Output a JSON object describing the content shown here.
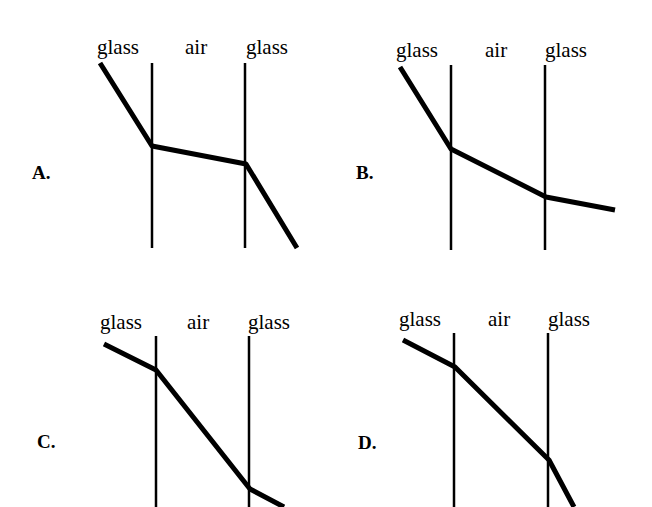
{
  "panels": [
    {
      "letter": "A.",
      "labels": [
        "glass",
        "air",
        "glass"
      ],
      "boundaries_x": [
        152,
        245
      ],
      "boundary_y": [
        63,
        248
      ],
      "ray": [
        [
          100,
          63
        ],
        [
          152,
          146
        ],
        [
          246,
          164
        ],
        [
          297,
          248
        ]
      ],
      "label_pos": [
        [
          97,
          37
        ],
        [
          185,
          37
        ],
        [
          246,
          37
        ]
      ],
      "letter_pos": [
        32,
        163
      ]
    },
    {
      "letter": "B.",
      "labels": [
        "glass",
        "air",
        "glass"
      ],
      "boundaries_x": [
        451,
        545
      ],
      "boundary_y": [
        65,
        250
      ],
      "ray": [
        [
          400,
          67
        ],
        [
          451,
          149
        ],
        [
          546,
          197
        ],
        [
          615,
          210
        ]
      ],
      "label_pos": [
        [
          396,
          40
        ],
        [
          485,
          40
        ],
        [
          545,
          40
        ]
      ],
      "letter_pos": [
        356,
        163
      ]
    },
    {
      "letter": "C.",
      "labels": [
        "glass",
        "air",
        "glass"
      ],
      "boundaries_x": [
        156,
        249
      ],
      "boundary_y": [
        336,
        507
      ],
      "ray": [
        [
          104,
          344
        ],
        [
          156,
          370
        ],
        [
          250,
          489
        ],
        [
          284,
          507
        ]
      ],
      "label_pos": [
        [
          100,
          312
        ],
        [
          187,
          312
        ],
        [
          248,
          312
        ]
      ],
      "letter_pos": [
        37,
        432
      ]
    },
    {
      "letter": "D.",
      "labels": [
        "glass",
        "air",
        "glass"
      ],
      "boundaries_x": [
        454,
        548
      ],
      "boundary_y": [
        333,
        507
      ],
      "ray": [
        [
          403,
          340
        ],
        [
          455,
          367
        ],
        [
          549,
          460
        ],
        [
          574,
          507
        ]
      ],
      "label_pos": [
        [
          399,
          309
        ],
        [
          488,
          309
        ],
        [
          548,
          309
        ]
      ],
      "letter_pos": [
        358,
        433
      ]
    }
  ],
  "style": {
    "ray_color": "#000000",
    "ray_width": 5,
    "boundary_width": 2.5
  }
}
